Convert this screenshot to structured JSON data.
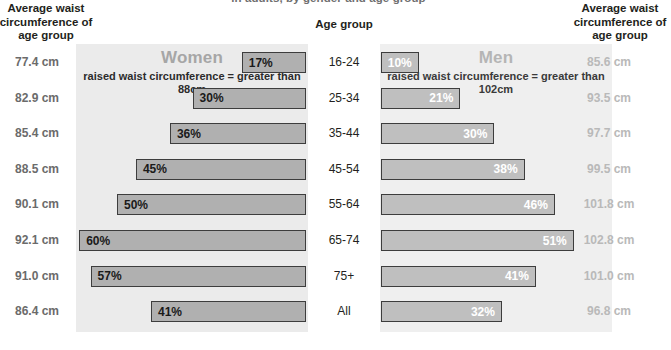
{
  "title": "in adults, by gender and age group",
  "headers": {
    "left": "Average waist circumference of age group",
    "right": "Average waist circumference of age group",
    "age": "Age group"
  },
  "panels": {
    "women": {
      "title": "Women",
      "subtitle": "raised waist circumference = greater than 88cm"
    },
    "men": {
      "title": "Men",
      "subtitle": "raised waist circumference = greater than 102cm"
    }
  },
  "colors": {
    "panel_women_bg": "#ebebeb",
    "panel_men_bg": "#efefef",
    "bar_women": "#b0b0b0",
    "bar_men": "#bfbfbf",
    "bar_border": "#3d3d3d",
    "avg_left_text": "#6b6b6b",
    "avg_right_text": "#b9b9b9",
    "panel_title_text": "#a6a6a6"
  },
  "chart_data": {
    "type": "bar",
    "title": "in adults, by gender and age group",
    "xlabel": "",
    "ylabel": "Age group",
    "orientation": "horizontal-mirrored",
    "xlim": [
      0,
      62
    ],
    "grid": false,
    "legend": "none",
    "categories": [
      "16-24",
      "25-34",
      "35-44",
      "45-54",
      "55-64",
      "65-74",
      "75+",
      "All"
    ],
    "series": [
      {
        "name": "Women",
        "unit": "%",
        "note": "raised waist circumference = greater than 88cm",
        "values": [
          17,
          30,
          36,
          45,
          50,
          60,
          57,
          41
        ],
        "labels": [
          "17%",
          "30%",
          "36%",
          "45%",
          "50%",
          "60%",
          "57%",
          "41%"
        ]
      },
      {
        "name": "Men",
        "unit": "%",
        "note": "raised waist circumference = greater than 102cm",
        "values": [
          10,
          21,
          30,
          38,
          46,
          51,
          41,
          32
        ],
        "labels": [
          "10%",
          "21%",
          "30%",
          "38%",
          "46%",
          "51%",
          "41%",
          "32%"
        ]
      }
    ],
    "annotations": {
      "avg_waist_women_cm": [
        "77.4 cm",
        "82.9 cm",
        "85.4 cm",
        "88.5 cm",
        "90.1 cm",
        "92.1 cm",
        "91.0 cm",
        "86.4 cm"
      ],
      "avg_waist_men_cm": [
        "85.6 cm",
        "93.5 cm",
        "97.7 cm",
        "99.5 cm",
        "101.8 cm",
        "102.8 cm",
        "101.0 cm",
        "96.8 cm"
      ]
    }
  },
  "rows": [
    {
      "age": "16-24",
      "women_pct": 17,
      "women_label": "17%",
      "men_pct": 10,
      "men_label": "10%",
      "avg_left": "77.4 cm",
      "avg_right": "85.6 cm"
    },
    {
      "age": "25-34",
      "women_pct": 30,
      "women_label": "30%",
      "men_pct": 21,
      "men_label": "21%",
      "avg_left": "82.9 cm",
      "avg_right": "93.5 cm"
    },
    {
      "age": "35-44",
      "women_pct": 36,
      "women_label": "36%",
      "men_pct": 30,
      "men_label": "30%",
      "avg_left": "85.4 cm",
      "avg_right": "97.7 cm"
    },
    {
      "age": "45-54",
      "women_pct": 45,
      "women_label": "45%",
      "men_pct": 38,
      "men_label": "38%",
      "avg_left": "88.5 cm",
      "avg_right": "99.5 cm"
    },
    {
      "age": "55-64",
      "women_pct": 50,
      "women_label": "50%",
      "men_pct": 46,
      "men_label": "46%",
      "avg_left": "90.1 cm",
      "avg_right": "101.8 cm"
    },
    {
      "age": "65-74",
      "women_pct": 60,
      "women_label": "60%",
      "men_pct": 51,
      "men_label": "51%",
      "avg_left": "92.1 cm",
      "avg_right": "102.8 cm"
    },
    {
      "age": "75+",
      "women_pct": 57,
      "women_label": "57%",
      "men_pct": 41,
      "men_label": "41%",
      "avg_left": "91.0 cm",
      "avg_right": "101.0 cm"
    },
    {
      "age": "All",
      "women_pct": 41,
      "women_label": "41%",
      "men_pct": 32,
      "men_label": "32%",
      "avg_left": "86.4 cm",
      "avg_right": "96.8 cm"
    }
  ]
}
